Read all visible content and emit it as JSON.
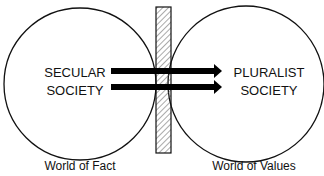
{
  "diagram": {
    "left_circle": {
      "line1": "SECULAR",
      "line2": "SOCIETY",
      "caption": "World of Fact"
    },
    "right_circle": {
      "line1": "PLURALIST",
      "line2": "SOCIETY",
      "caption": "World of Values"
    },
    "barrier": {
      "style": "hatched"
    },
    "arrows": {
      "count": 2,
      "direction": "left-to-right"
    }
  }
}
